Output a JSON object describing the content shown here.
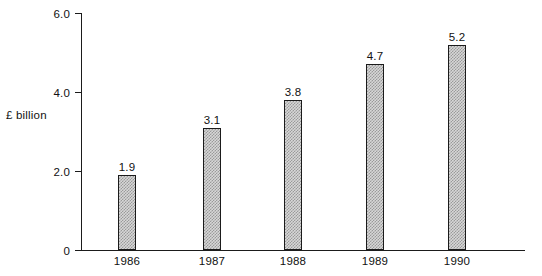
{
  "chart_data": {
    "type": "bar",
    "title": "",
    "subtitle": "",
    "xlabel": "",
    "ylabel": "£ billion",
    "categories": [
      "1986",
      "1987",
      "1988",
      "1989",
      "1990"
    ],
    "values": [
      1.9,
      3.1,
      3.8,
      4.7,
      5.2
    ],
    "data_labels": [
      "1.9",
      "3.1",
      "3.8",
      "4.7",
      "5.2"
    ],
    "ylim": [
      0,
      6.0
    ],
    "ytick_values": [
      0,
      2.0,
      4.0,
      6.0
    ],
    "ytick_labels": [
      "0",
      "2.0",
      "4.0",
      "6.0"
    ],
    "grid": false,
    "legend": false,
    "legend_position": "none",
    "bar_fill": "#d7d7d7",
    "bar_hatch": "crosshatch-dither",
    "bar_edge_color": "#1b1b1b",
    "axis_color": "#1b1b1b",
    "text_color": "#111111",
    "background": "#ffffff"
  }
}
